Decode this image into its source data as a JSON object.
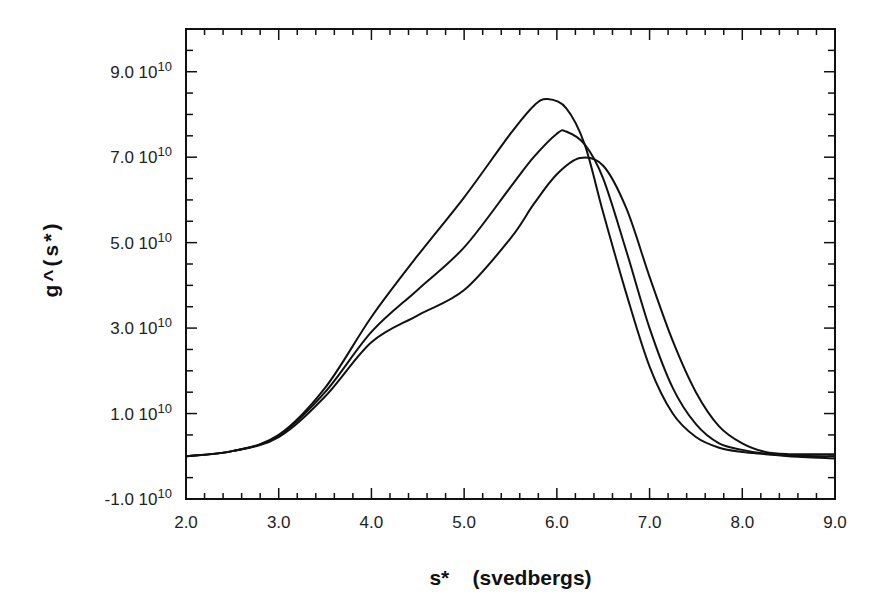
{
  "chart_data": {
    "type": "line",
    "title": "",
    "xlabel": "s*    (svedbergs)",
    "ylabel": "g^(s*)",
    "xlim": [
      2.0,
      9.0
    ],
    "ylim": [
      -1.0,
      10.0
    ],
    "y_unit_exponent": 10,
    "grid": false,
    "legend": "none",
    "x_ticks": [
      {
        "value": 2.0,
        "label": "2.0"
      },
      {
        "value": 3.0,
        "label": "3.0"
      },
      {
        "value": 4.0,
        "label": "4.0"
      },
      {
        "value": 5.0,
        "label": "5.0"
      },
      {
        "value": 6.0,
        "label": "6.0"
      },
      {
        "value": 7.0,
        "label": "7.0"
      },
      {
        "value": 8.0,
        "label": "8.0"
      },
      {
        "value": 9.0,
        "label": "9.0"
      }
    ],
    "x_minor_step": 0.2,
    "y_ticks": [
      {
        "value": -1.0,
        "mantissa": "-1.0",
        "base": "10",
        "exponent": "10"
      },
      {
        "value": 1.0,
        "mantissa": "1.0",
        "base": "10",
        "exponent": "10"
      },
      {
        "value": 3.0,
        "mantissa": "3.0",
        "base": "10",
        "exponent": "10"
      },
      {
        "value": 5.0,
        "mantissa": "5.0",
        "base": "10",
        "exponent": "10"
      },
      {
        "value": 7.0,
        "mantissa": "7.0",
        "base": "10",
        "exponent": "10"
      },
      {
        "value": 9.0,
        "mantissa": "9.0",
        "base": "10",
        "exponent": "10"
      }
    ],
    "y_minor_step": 0.5,
    "series": [
      {
        "name": "curve-1",
        "x": [
          2.0,
          2.5,
          3.0,
          3.5,
          4.0,
          4.5,
          5.0,
          5.5,
          5.75,
          5.9,
          6.1,
          6.3,
          6.5,
          6.75,
          7.0,
          7.25,
          7.5,
          7.75,
          8.0,
          8.25,
          8.5,
          9.0
        ],
        "y": [
          0.0,
          0.12,
          0.5,
          1.6,
          3.26,
          4.7,
          6.06,
          7.55,
          8.2,
          8.36,
          8.15,
          7.3,
          5.7,
          3.8,
          2.1,
          1.0,
          0.45,
          0.2,
          0.1,
          0.05,
          0.0,
          -0.05
        ]
      },
      {
        "name": "curve-2",
        "x": [
          2.0,
          2.5,
          3.0,
          3.5,
          4.0,
          4.5,
          5.0,
          5.5,
          5.75,
          6.0,
          6.1,
          6.3,
          6.5,
          6.75,
          7.0,
          7.25,
          7.5,
          7.75,
          8.0,
          8.25,
          8.5,
          9.0
        ],
        "y": [
          0.0,
          0.12,
          0.48,
          1.5,
          2.91,
          3.9,
          4.89,
          6.3,
          7.0,
          7.55,
          7.6,
          7.3,
          6.5,
          4.8,
          3.0,
          1.6,
          0.75,
          0.3,
          0.15,
          0.06,
          0.02,
          0.0
        ]
      },
      {
        "name": "curve-3",
        "x": [
          2.0,
          2.5,
          3.0,
          3.5,
          4.0,
          4.5,
          5.0,
          5.5,
          5.75,
          6.0,
          6.25,
          6.5,
          6.75,
          7.0,
          7.25,
          7.5,
          7.75,
          8.0,
          8.25,
          8.5,
          9.0
        ],
        "y": [
          0.0,
          0.12,
          0.45,
          1.4,
          2.67,
          3.3,
          3.89,
          5.1,
          5.9,
          6.6,
          6.98,
          6.8,
          5.8,
          4.2,
          2.7,
          1.5,
          0.7,
          0.3,
          0.1,
          0.05,
          0.05
        ]
      }
    ]
  }
}
